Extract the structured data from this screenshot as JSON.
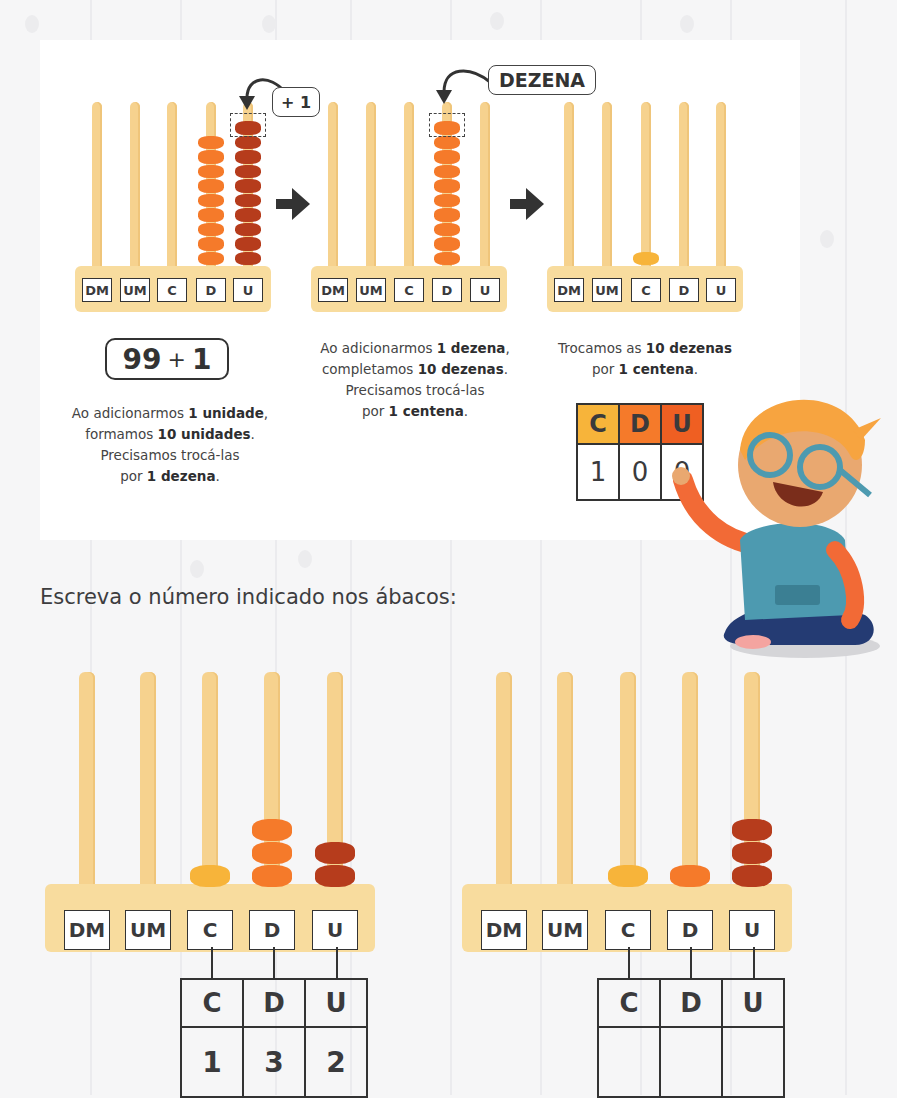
{
  "colors": {
    "rod": "#f6d28e",
    "base": "#f8dc9e",
    "bead_centena": "#f7b43a",
    "bead_dezena": "#f57a2a",
    "bead_unidade": "#b63c1c",
    "header_c": "#f7b43a",
    "header_d": "#f57a2a",
    "header_u": "#ef5f22"
  },
  "place_labels": [
    "DM",
    "UM",
    "C",
    "D",
    "U"
  ],
  "example": {
    "step1": {
      "tag": "+ 1",
      "beads": {
        "DM": 0,
        "UM": 0,
        "C": 0,
        "D": 9,
        "U": 10
      },
      "sum": {
        "left": "99",
        "op": "+",
        "right": "1"
      },
      "text": {
        "l1a": "Ao adicionarmos ",
        "l1b": "1 unidade",
        "l1c": ",",
        "l2a": "formamos ",
        "l2b": "10 unidades",
        "l2c": ".",
        "l3": "Precisamos trocá-las",
        "l4a": "por ",
        "l4b": "1 dezena",
        "l4c": "."
      }
    },
    "step2": {
      "tag": "DEZENA",
      "beads": {
        "DM": 0,
        "UM": 0,
        "C": 0,
        "D": 10,
        "U": 0
      },
      "text": {
        "l1a": "Ao adicionarmos ",
        "l1b": "1 dezena",
        "l1c": ",",
        "l2a": "completamos ",
        "l2b": "10 dezenas",
        "l2c": ".",
        "l3": "Precisamos trocá-las",
        "l4a": "por ",
        "l4b": "1 centena",
        "l4c": "."
      }
    },
    "step3": {
      "beads": {
        "DM": 0,
        "UM": 0,
        "C": 1,
        "D": 0,
        "U": 0
      },
      "text": {
        "l1a": "Trocamos as ",
        "l1b": "10 dezenas",
        "l2a": "por ",
        "l2b": "1 centena",
        "l2c": "."
      },
      "table": {
        "headers": [
          "C",
          "D",
          "U"
        ],
        "values": [
          "1",
          "0",
          "0"
        ]
      }
    }
  },
  "instruction": "Escreva o número indicado nos ábacos:",
  "exercises": [
    {
      "beads": {
        "DM": 0,
        "UM": 0,
        "C": 1,
        "D": 3,
        "U": 2
      },
      "table": {
        "headers": [
          "C",
          "D",
          "U"
        ],
        "values": [
          "1",
          "3",
          "2"
        ]
      }
    },
    {
      "beads": {
        "DM": 0,
        "UM": 0,
        "C": 1,
        "D": 1,
        "U": 3
      },
      "table": {
        "headers": [
          "C",
          "D",
          "U"
        ],
        "values": [
          "",
          "",
          ""
        ]
      }
    }
  ]
}
